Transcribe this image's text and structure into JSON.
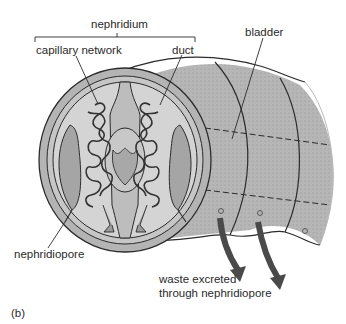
{
  "figure": {
    "panel_label": "(b)",
    "labels": {
      "nephridium": "nephridium",
      "capillary_network": "capillary network",
      "duct": "duct",
      "bladder": "bladder",
      "nephridiopore": "nephridiopore",
      "waste_line1": "waste excreted",
      "waste_line2": "through nephridiopore"
    },
    "colors": {
      "body_fill": "#b9b9b9",
      "cross_section_fill": "#cfcfcf",
      "outline": "#2b2b2b",
      "arrow": "#4a4a4a",
      "text": "#2a2a2a"
    }
  }
}
